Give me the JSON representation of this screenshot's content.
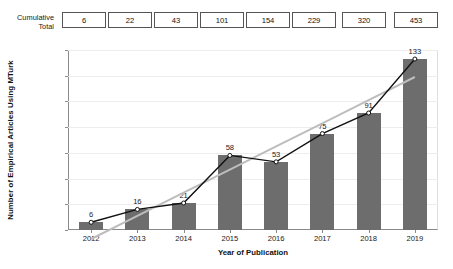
{
  "cumulative": {
    "label": "Cumulative\nTotal",
    "values": [
      6,
      22,
      43,
      101,
      154,
      229,
      320,
      453
    ]
  },
  "chart_data": {
    "type": "bar",
    "title": "",
    "xlabel": "Year of Publication",
    "ylabel": "Number of Empirical Articles Using MTurk",
    "categories": [
      "2012",
      "2013",
      "2014",
      "2015",
      "2016",
      "2017",
      "2018",
      "2019"
    ],
    "values": [
      6,
      16,
      21,
      58,
      53,
      75,
      91,
      133
    ],
    "ylim": [
      0,
      140
    ],
    "yticks": [
      0,
      20,
      40,
      60,
      80,
      100,
      120,
      140
    ],
    "grid": true,
    "legend": "none",
    "series": [
      {
        "name": "Empirical articles per year",
        "type": "bar",
        "color": "#6d6d6d",
        "values": [
          6,
          16,
          21,
          58,
          53,
          75,
          91,
          133
        ]
      },
      {
        "name": "Connecting line with markers",
        "type": "line",
        "color": "#111111",
        "marker": "open-circle",
        "values": [
          6,
          16,
          21,
          58,
          53,
          75,
          91,
          133
        ]
      },
      {
        "name": "Linear trend line",
        "type": "line",
        "color": "#bdbdbd",
        "values": [
          -7,
          11,
          29,
          47,
          65,
          83,
          101,
          119
        ]
      }
    ],
    "annotations": {
      "cumulative_total_label": "Cumulative Total",
      "cumulative_total_values": [
        6,
        22,
        43,
        101,
        154,
        229,
        320,
        453
      ]
    }
  },
  "colors": {
    "bar": "#6d6d6d",
    "line": "#111111",
    "trend": "#bdbdbd",
    "axis": "#8a8a8a",
    "grid": "#ededed",
    "background": "#ffffff"
  }
}
